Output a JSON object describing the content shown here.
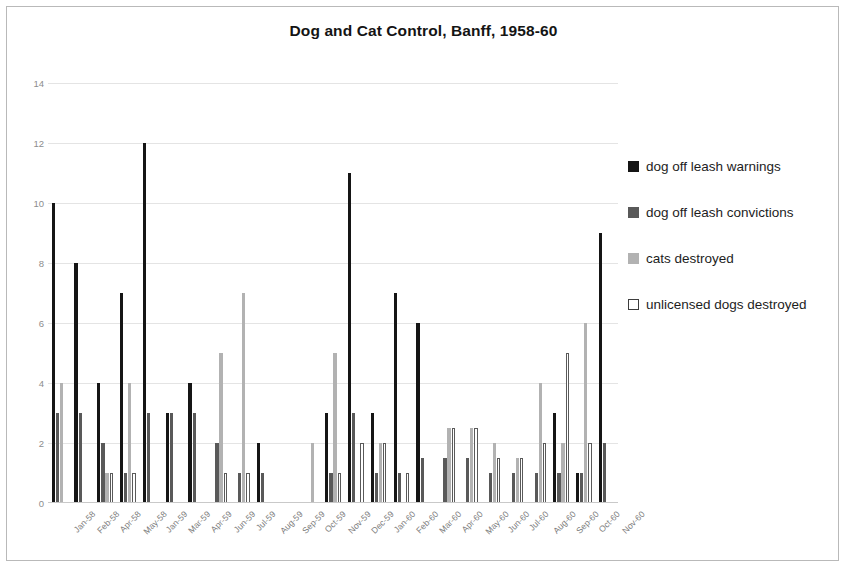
{
  "chart_data": {
    "type": "bar",
    "title": "Dog and Cat Control, Banff, 1958-60",
    "xlabel": "",
    "ylabel": "",
    "ylim": [
      0,
      14
    ],
    "yticks": [
      0,
      2,
      4,
      6,
      8,
      10,
      12,
      14
    ],
    "grid": true,
    "legend_position": "right",
    "categories": [
      "Jan-58",
      "Feb-58",
      "Apr-58",
      "May-58",
      "Jan-59",
      "Mar-59",
      "Apr-59",
      "Jun-59",
      "Jul-59",
      "Aug-59",
      "Sep-59",
      "Oct-59",
      "Nov-59",
      "Dec-59",
      "Jan-60",
      "Feb-60",
      "Mar-60",
      "Apr-60",
      "May-60",
      "Jun-60",
      "Jul-60",
      "Aug-60",
      "Sep-60",
      "Oct-60",
      "Nov-60"
    ],
    "series": [
      {
        "name": "dog off leash warnings",
        "color": "#151515",
        "values": [
          10,
          8,
          4,
          7,
          12,
          3,
          4,
          0,
          0,
          2,
          0,
          0,
          3,
          11,
          3,
          7,
          6,
          0,
          0,
          0,
          0,
          0,
          3,
          1,
          9
        ]
      },
      {
        "name": "dog off leash convictions",
        "color": "#595959",
        "values": [
          3,
          3,
          2,
          1,
          3,
          3,
          3,
          2,
          1,
          1,
          0,
          0,
          1,
          3,
          1,
          1,
          1.5,
          1.5,
          1.5,
          1,
          1,
          1,
          1,
          1,
          2
        ]
      },
      {
        "name": "cats destroyed",
        "color": "#b2b2b2",
        "values": [
          4,
          0,
          1,
          4,
          0,
          0,
          0,
          5,
          7,
          0,
          0,
          2,
          5,
          0,
          2,
          0,
          0,
          2.5,
          2.5,
          2,
          1.5,
          4,
          2,
          6,
          0
        ]
      },
      {
        "name": "unlicensed dogs destroyed",
        "color": "#ffffff",
        "values": [
          0,
          0,
          1,
          1,
          0,
          0,
          0,
          1,
          1,
          0,
          0,
          0,
          1,
          2,
          2,
          1,
          0,
          2.5,
          2.5,
          1.5,
          1.5,
          2,
          5,
          2,
          0
        ]
      }
    ]
  },
  "legend": {
    "items": [
      {
        "label": "dog off leash warnings",
        "swatch": "filled-black-square-icon"
      },
      {
        "label": "dog off leash convictions",
        "swatch": "filled-darkgray-square-icon"
      },
      {
        "label": "cats destroyed",
        "swatch": "filled-lightgray-square-icon"
      },
      {
        "label": "unlicensed dogs destroyed",
        "swatch": "outlined-white-square-icon"
      }
    ]
  }
}
